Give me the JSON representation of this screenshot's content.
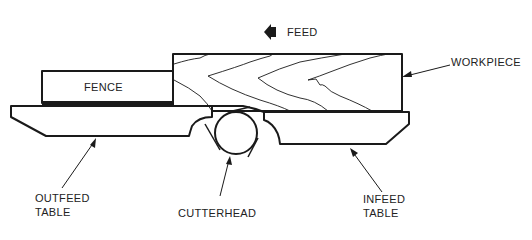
{
  "diagram": {
    "colors": {
      "line": "#1a1a1a",
      "text": "#222222",
      "background": "#ffffff"
    },
    "labels": {
      "feed": "FEED",
      "fence": "FENCE",
      "workpiece": "WORKPIECE",
      "outfeed_line1": "OUTFEED",
      "outfeed_line2": "TABLE",
      "cutterhead": "CUTTERHEAD",
      "infeed_line1": "INFEED",
      "infeed_line2": "TABLE"
    },
    "icons": {
      "feed_direction": "left-arrow-icon"
    }
  }
}
